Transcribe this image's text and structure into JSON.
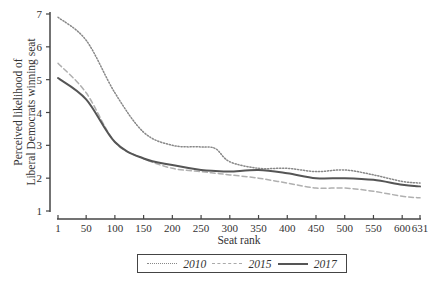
{
  "chart_data": {
    "type": "line",
    "title": "",
    "xlabel": "Seat rank",
    "ylabel": "Perceived likelihood of Liberal Democrats winning seat",
    "ylabel_lines": [
      "Perceived likelihood of",
      "Liberal Democrats winning seat"
    ],
    "xlim": [
      1,
      631
    ],
    "ylim": [
      1,
      7
    ],
    "x_ticks": [
      1,
      50,
      100,
      150,
      200,
      250,
      300,
      350,
      400,
      450,
      500,
      550,
      600,
      631
    ],
    "y_ticks": [
      1,
      2,
      3,
      4,
      5,
      6,
      7
    ],
    "grid": false,
    "legend_position": "bottom",
    "x": [
      1,
      50,
      100,
      150,
      200,
      250,
      275,
      300,
      350,
      400,
      450,
      500,
      550,
      600,
      631
    ],
    "series": [
      {
        "name": "2010",
        "style": "dotted",
        "color": "#888888",
        "values": [
          6.9,
          6.2,
          4.6,
          3.4,
          3.0,
          2.95,
          2.9,
          2.5,
          2.3,
          2.3,
          2.2,
          2.25,
          2.1,
          1.9,
          1.85
        ]
      },
      {
        "name": "2015",
        "style": "dashed",
        "color": "#b0b0b0",
        "values": [
          5.5,
          4.6,
          3.1,
          2.6,
          2.3,
          2.2,
          2.15,
          2.1,
          2.0,
          1.85,
          1.7,
          1.7,
          1.6,
          1.45,
          1.4
        ]
      },
      {
        "name": "2017",
        "style": "solid",
        "color": "#555555",
        "values": [
          5.05,
          4.4,
          3.1,
          2.6,
          2.4,
          2.25,
          2.22,
          2.2,
          2.25,
          2.15,
          2.0,
          2.0,
          1.95,
          1.8,
          1.75
        ]
      }
    ]
  },
  "legend": {
    "items": [
      {
        "label": "2010"
      },
      {
        "label": "2015"
      },
      {
        "label": "2017"
      }
    ]
  }
}
